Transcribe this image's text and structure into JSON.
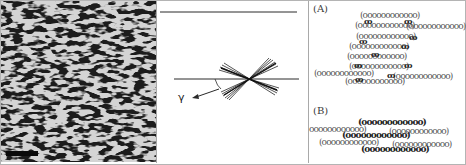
{
  "figure": {
    "panels": [
      {
        "id": "micrograph",
        "description": "textured micrograph of lamellar / fibrillar domains",
        "scale_bar": {
          "visible": true,
          "label": ""
        }
      },
      {
        "id": "angle-diagram",
        "angle_label": "γ",
        "description": "reference lines with fan of crossing lines; arrow indicating angle γ"
      },
      {
        "id": "fibril-schematics",
        "sublabels": [
          "(A)",
          "(B)"
        ],
        "coil_glyph": "(oooooooooooo)",
        "knot_glyph": "ꝏ"
      }
    ]
  },
  "colors": {
    "frame_border": "#b4b4b4",
    "micrograph_dark": "#1c1c1c",
    "micrograph_light": "#d8d8d8",
    "line": "#2a2a2a"
  },
  "panelA": {
    "label": "(A)",
    "rows": [
      "(oooooooooooo)",
      "(oooooooooooo)",
      "(oooooooooooo)",
      "(oooooooooooo)",
      "(oooooooooooo)",
      "(oooooooooooo)",
      "(oooooooooooo)",
      "(oooooooooooo)",
      "(oooooooooooo)",
      "(oooooooooooo)"
    ]
  },
  "panelB": {
    "label": "(B)",
    "rows": [
      "(oooooooooooo)",
      "oooooooooooo)",
      "(oooooooooooo)",
      "(oooooooooooo)",
      "(oooooooooooo)",
      "(oooooooooooo)",
      "(oooooooooooo)"
    ]
  }
}
